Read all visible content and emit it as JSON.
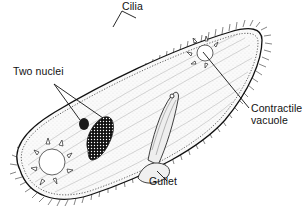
{
  "diagram": {
    "colors": {
      "ink": "#111111",
      "background": "#ffffff",
      "nucleus_fill": "#1a1a1a"
    },
    "labels": {
      "cilia": "Cilia",
      "nuclei": "Two nuclei",
      "contractile_vacuole_line1": "Contractile",
      "contractile_vacuole_line2": "vacuole",
      "gullet": "Gullet"
    }
  }
}
